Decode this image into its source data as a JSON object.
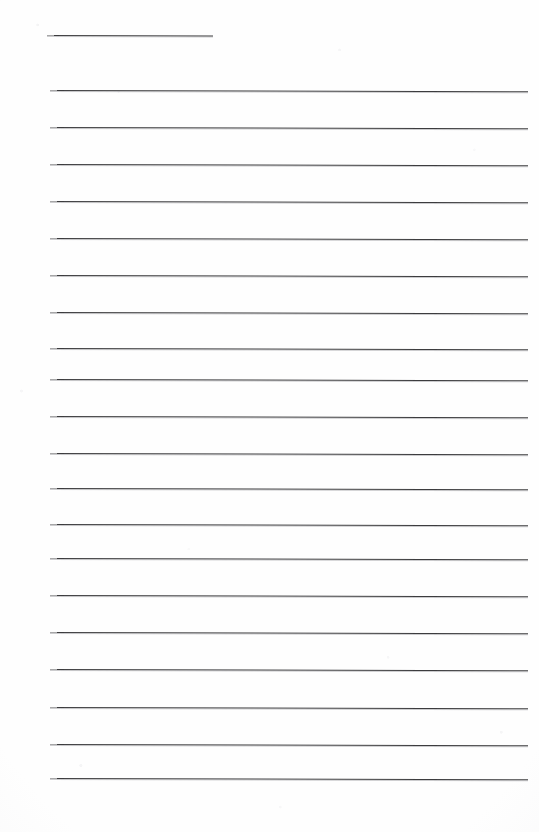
{
  "document": {
    "kind": "lined-notebook-page",
    "title_text": "",
    "body_text": "",
    "page_background_color": "#fefefe",
    "rule_color": "#3c3c3e",
    "rule_count_total": 20,
    "full_width_rule_count": 19,
    "short_rule_count": 1,
    "is_blank": true
  },
  "layout": {
    "page_width": 539,
    "page_height": 832,
    "left_margin": 50,
    "right_edge": 528,
    "line_spacing": 37
  },
  "rules": [
    {
      "name": "title-rule",
      "x": 47,
      "y": 35,
      "width": 166,
      "slope": 0.6,
      "thickness": 1
    },
    {
      "name": "body-rule-1",
      "x": 50,
      "y": 90,
      "width": 478,
      "slope": 1.2,
      "thickness": 1
    },
    {
      "name": "body-rule-2",
      "x": 50,
      "y": 127,
      "width": 478,
      "slope": 1.2,
      "thickness": 1
    },
    {
      "name": "body-rule-3",
      "x": 50,
      "y": 164,
      "width": 478,
      "slope": 1.2,
      "thickness": 1
    },
    {
      "name": "body-rule-4",
      "x": 50,
      "y": 201,
      "width": 478,
      "slope": 1.2,
      "thickness": 1
    },
    {
      "name": "body-rule-5",
      "x": 50,
      "y": 238,
      "width": 478,
      "slope": 1.2,
      "thickness": 1
    },
    {
      "name": "body-rule-6",
      "x": 50,
      "y": 275,
      "width": 478,
      "slope": 1.2,
      "thickness": 1
    },
    {
      "name": "body-rule-7",
      "x": 50,
      "y": 312,
      "width": 478,
      "slope": 1.2,
      "thickness": 1
    },
    {
      "name": "body-rule-8",
      "x": 50,
      "y": 348,
      "width": 478,
      "slope": 1.2,
      "thickness": 1
    },
    {
      "name": "body-rule-9",
      "x": 50,
      "y": 379,
      "width": 478,
      "slope": 1.2,
      "thickness": 1
    },
    {
      "name": "body-rule-10",
      "x": 50,
      "y": 416,
      "width": 478,
      "slope": 1.2,
      "thickness": 1
    },
    {
      "name": "body-rule-11",
      "x": 50,
      "y": 453,
      "width": 478,
      "slope": 1.2,
      "thickness": 1
    },
    {
      "name": "body-rule-12",
      "x": 50,
      "y": 488,
      "width": 478,
      "slope": 1.2,
      "thickness": 1
    },
    {
      "name": "body-rule-13",
      "x": 50,
      "y": 524,
      "width": 478,
      "slope": 1.2,
      "thickness": 1
    },
    {
      "name": "body-rule-14",
      "x": 50,
      "y": 558,
      "width": 478,
      "slope": 1.2,
      "thickness": 1
    },
    {
      "name": "body-rule-15",
      "x": 50,
      "y": 595,
      "width": 478,
      "slope": 1.2,
      "thickness": 1
    },
    {
      "name": "body-rule-16",
      "x": 50,
      "y": 632,
      "width": 478,
      "slope": 1.2,
      "thickness": 1
    },
    {
      "name": "body-rule-17",
      "x": 50,
      "y": 669,
      "width": 478,
      "slope": 1.2,
      "thickness": 1
    },
    {
      "name": "body-rule-18",
      "x": 50,
      "y": 707,
      "width": 478,
      "slope": 1.2,
      "thickness": 1
    },
    {
      "name": "body-rule-19",
      "x": 50,
      "y": 744,
      "width": 478,
      "slope": 1.2,
      "thickness": 1
    },
    {
      "name": "body-rule-20",
      "x": 50,
      "y": 778,
      "width": 478,
      "slope": 1.2,
      "thickness": 1
    }
  ]
}
